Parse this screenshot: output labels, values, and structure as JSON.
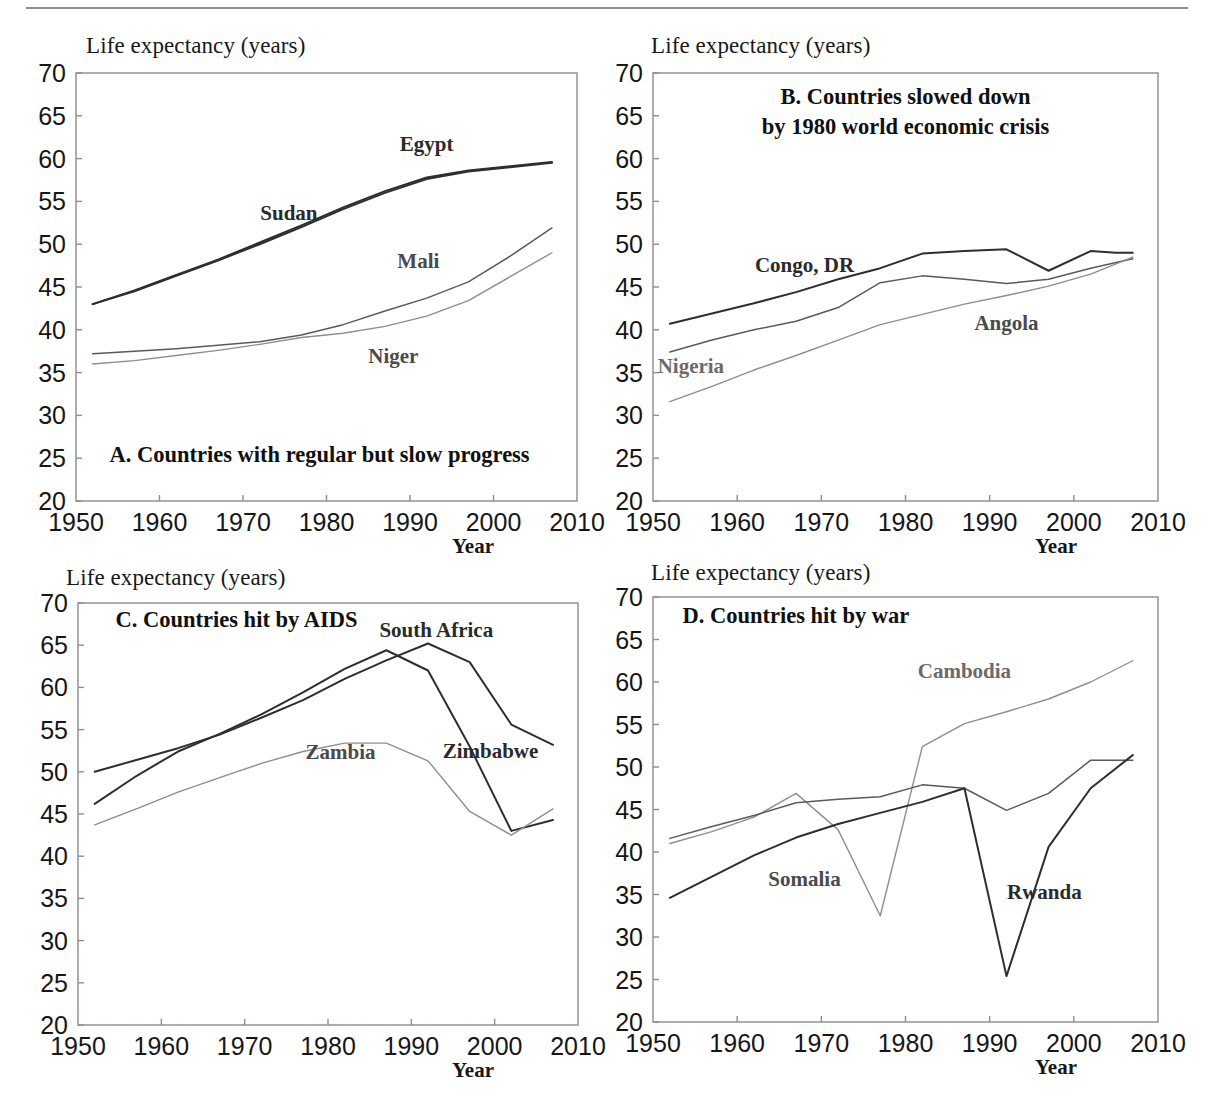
{
  "figure": {
    "axis_title": "Life expectancy (years)",
    "x_axis_label": "Year",
    "y_ticks": [
      70,
      65,
      60,
      55,
      50,
      45,
      40,
      35,
      30,
      25,
      20
    ],
    "x_ticks": [
      1950,
      1960,
      1970,
      1980,
      1990,
      2000,
      2010
    ],
    "colors": {
      "dark": "#2e2e2e",
      "mid": "#5a5a5a",
      "light": "#8e8e8e",
      "frame": "#9a9a9a",
      "text": "#161616"
    }
  },
  "panels": [
    {
      "id": "A",
      "caption": "A. Countries with regular but slow progress",
      "caption_pos": {
        "x": 1954.0,
        "y": 24.6
      },
      "labels": [
        {
          "name": "Egypt",
          "x": 1992.0,
          "y": 60.9,
          "tone": "dark"
        },
        {
          "name": "Sudan",
          "x": 1975.5,
          "y": 52.8,
          "tone": "dark"
        },
        {
          "name": "Mali",
          "x": 1991.0,
          "y": 47.2,
          "tone": "mid"
        },
        {
          "name": "Niger",
          "x": 1988.0,
          "y": 36.1,
          "tone": "mid"
        }
      ]
    },
    {
      "id": "B",
      "caption": "B. Countries slowed down\nby 1980 world economic crisis",
      "caption_pos": {
        "x": 1980.0,
        "y": 66.4
      },
      "labels": [
        {
          "name": "Congo, DR",
          "x": 1968.0,
          "y": 46.8,
          "tone": "dark"
        },
        {
          "name": "Angola",
          "x": 1992.0,
          "y": 40.0,
          "tone": "mid"
        },
        {
          "name": "Nigeria",
          "x": 1954.5,
          "y": 35.0,
          "tone": "light"
        }
      ]
    },
    {
      "id": "C",
      "caption": "C. Countries hit by AIDS",
      "caption_pos": {
        "x": 1954.5,
        "y": 67.1
      },
      "labels": [
        {
          "name": "South Africa",
          "x": 1993.0,
          "y": 66.0,
          "tone": "dark"
        },
        {
          "name": "Zambia",
          "x": 1981.5,
          "y": 51.5,
          "tone": "mid"
        },
        {
          "name": "Zimbabwe",
          "x": 1999.5,
          "y": 51.6,
          "tone": "dark"
        }
      ]
    },
    {
      "id": "D",
      "caption": "D. Countries hit by war",
      "caption_pos": {
        "x": 1953.5,
        "y": 67.0
      },
      "labels": [
        {
          "name": "Cambodia",
          "x": 1987.0,
          "y": 60.5,
          "tone": "light"
        },
        {
          "name": "Somalia",
          "x": 1968.0,
          "y": 36.0,
          "tone": "mid"
        },
        {
          "name": "Rwanda",
          "x": 1996.5,
          "y": 34.5,
          "tone": "dark"
        }
      ]
    }
  ],
  "chart_data": [
    {
      "type": "line",
      "panel": "A",
      "title": "A. Countries with regular but slow progress",
      "xlabel": "Year",
      "ylabel": "Life expectancy (years)",
      "xlim": [
        1950,
        2010
      ],
      "ylim": [
        20,
        70
      ],
      "grid": false,
      "legend": "inline-labels",
      "series": [
        {
          "name": "Egypt",
          "tone": "dark",
          "x": [
            1952,
            1957,
            1962,
            1967,
            1972,
            1977,
            1982,
            1987,
            1992,
            1997,
            2002,
            2007
          ],
          "values": [
            43.0,
            44.6,
            46.4,
            48.2,
            50.2,
            52.2,
            54.3,
            56.2,
            57.8,
            58.6,
            59.1,
            59.6
          ]
        },
        {
          "name": "Sudan",
          "tone": "dark",
          "x": [
            1952,
            1957,
            1962,
            1967,
            1972,
            1977,
            1982,
            1987,
            1992,
            1997,
            2002,
            2007
          ],
          "values": [
            43.0,
            44.5,
            46.3,
            48.1,
            50.0,
            52.0,
            54.1,
            56.0,
            57.6,
            58.5,
            59.0,
            59.5
          ]
        },
        {
          "name": "Mali",
          "tone": "mid",
          "x": [
            1952,
            1957,
            1962,
            1967,
            1972,
            1977,
            1982,
            1987,
            1992,
            1997,
            2002,
            2007
          ],
          "values": [
            37.2,
            37.5,
            37.8,
            38.2,
            38.6,
            39.4,
            40.6,
            42.2,
            43.7,
            45.6,
            48.6,
            51.9
          ]
        },
        {
          "name": "Niger",
          "tone": "light",
          "x": [
            1952,
            1957,
            1962,
            1967,
            1972,
            1977,
            1982,
            1987,
            1992,
            1997,
            2002,
            2007
          ],
          "values": [
            36.0,
            36.4,
            37.0,
            37.6,
            38.3,
            39.1,
            39.6,
            40.4,
            41.6,
            43.4,
            46.2,
            49.0
          ]
        }
      ]
    },
    {
      "type": "line",
      "panel": "B",
      "title": "B. Countries slowed down by 1980 world economic crisis",
      "xlabel": "Year",
      "ylabel": "Life expectancy (years)",
      "xlim": [
        1950,
        2010
      ],
      "ylim": [
        20,
        70
      ],
      "grid": false,
      "legend": "inline-labels",
      "series": [
        {
          "name": "Congo, DR",
          "tone": "dark",
          "x": [
            1952,
            1957,
            1962,
            1967,
            1972,
            1977,
            1982,
            1987,
            1992,
            1997,
            2002,
            2005,
            2007
          ],
          "values": [
            40.7,
            41.9,
            43.1,
            44.4,
            45.9,
            47.2,
            48.9,
            49.2,
            49.4,
            46.9,
            49.2,
            49.0,
            49.0
          ]
        },
        {
          "name": "Angola",
          "tone": "mid",
          "x": [
            1952,
            1957,
            1962,
            1967,
            1972,
            1977,
            1982,
            1987,
            1992,
            1997,
            2002,
            2007
          ],
          "values": [
            37.4,
            38.8,
            40.0,
            41.0,
            42.6,
            45.5,
            46.3,
            45.9,
            45.4,
            45.9,
            47.2,
            48.3
          ]
        },
        {
          "name": "Nigeria",
          "tone": "light",
          "x": [
            1952,
            1957,
            1962,
            1967,
            1972,
            1977,
            1982,
            1987,
            1992,
            1997,
            2002,
            2007
          ],
          "values": [
            31.6,
            33.4,
            35.3,
            37.0,
            38.8,
            40.6,
            41.8,
            43.0,
            44.0,
            45.1,
            46.5,
            48.5
          ]
        }
      ]
    },
    {
      "type": "line",
      "panel": "C",
      "title": "C. Countries hit by AIDS",
      "xlabel": "Year",
      "ylabel": "Life expectancy (years)",
      "xlim": [
        1950,
        2010
      ],
      "ylim": [
        20,
        70
      ],
      "grid": false,
      "legend": "inline-labels",
      "series": [
        {
          "name": "South Africa",
          "tone": "dark",
          "x": [
            1952,
            1957,
            1962,
            1967,
            1972,
            1977,
            1982,
            1987,
            1992,
            1997,
            2002,
            2007
          ],
          "values": [
            50.0,
            51.4,
            52.8,
            54.4,
            56.4,
            58.5,
            61.0,
            63.2,
            65.2,
            63.0,
            55.6,
            53.2
          ]
        },
        {
          "name": "Zimbabwe",
          "tone": "dark",
          "x": [
            1952,
            1957,
            1962,
            1967,
            1972,
            1977,
            1982,
            1987,
            1992,
            1997,
            2002,
            2007
          ],
          "values": [
            46.2,
            49.5,
            52.4,
            54.5,
            56.8,
            59.4,
            62.2,
            64.4,
            62.0,
            53.0,
            43.0,
            44.3
          ]
        },
        {
          "name": "Zambia",
          "tone": "light",
          "x": [
            1952,
            1957,
            1962,
            1967,
            1972,
            1977,
            1982,
            1987,
            1992,
            1997,
            2002,
            2007
          ],
          "values": [
            43.7,
            45.6,
            47.6,
            49.3,
            51.0,
            52.4,
            53.4,
            53.4,
            51.3,
            45.3,
            42.5,
            45.6
          ]
        }
      ]
    },
    {
      "type": "line",
      "panel": "D",
      "title": "D. Countries hit by war",
      "xlabel": "Year",
      "ylabel": "Life expectancy (years)",
      "xlim": [
        1950,
        2010
      ],
      "ylim": [
        20,
        70
      ],
      "grid": false,
      "legend": "inline-labels",
      "series": [
        {
          "name": "Cambodia",
          "tone": "light",
          "x": [
            1952,
            1957,
            1962,
            1967,
            1972,
            1977,
            1982,
            1987,
            1992,
            1997,
            2002,
            2007
          ],
          "values": [
            41.0,
            42.4,
            44.1,
            46.9,
            42.6,
            32.5,
            52.4,
            55.1,
            56.5,
            58.0,
            60.0,
            62.5
          ]
        },
        {
          "name": "Somalia",
          "tone": "mid",
          "x": [
            1952,
            1957,
            1962,
            1967,
            1972,
            1977,
            1982,
            1987,
            1992,
            1997,
            2002,
            2007
          ],
          "values": [
            41.6,
            43.0,
            44.3,
            45.8,
            46.2,
            46.5,
            47.9,
            47.5,
            44.9,
            46.9,
            50.8,
            50.8
          ]
        },
        {
          "name": "Rwanda",
          "tone": "dark",
          "x": [
            1952,
            1957,
            1962,
            1967,
            1972,
            1977,
            1982,
            1987,
            1992,
            1997,
            2002,
            2007
          ],
          "values": [
            34.6,
            37.1,
            39.6,
            41.7,
            43.3,
            44.6,
            45.9,
            47.5,
            25.4,
            40.6,
            47.5,
            51.4
          ]
        }
      ]
    }
  ]
}
